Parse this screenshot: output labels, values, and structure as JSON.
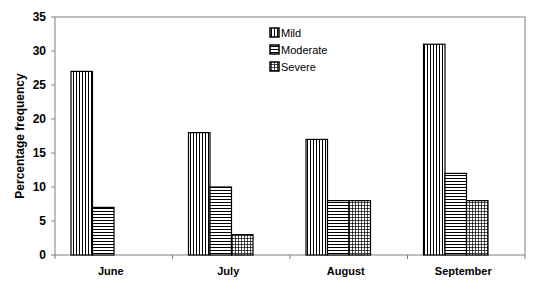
{
  "chart_data": {
    "type": "bar",
    "title": "",
    "xlabel": "",
    "ylabel": "Percentage frequency",
    "ylim": [
      0,
      35
    ],
    "yticks": [
      0,
      5,
      10,
      15,
      20,
      25,
      30,
      35
    ],
    "categories": [
      "June",
      "July",
      "August",
      "September"
    ],
    "series": [
      {
        "name": "Mild",
        "pattern": "vertical-lines",
        "values": [
          27,
          18,
          17,
          31
        ]
      },
      {
        "name": "Moderate",
        "pattern": "horizontal-lines",
        "values": [
          7,
          10,
          8,
          12
        ]
      },
      {
        "name": "Severe",
        "pattern": "grid",
        "values": [
          0,
          3,
          8,
          8
        ]
      }
    ],
    "grid": false,
    "legend_position": "top-center-inside"
  },
  "colors": {
    "bar_fill": "#ffffff",
    "bar_stroke": "#000000",
    "axis": "#808080"
  }
}
